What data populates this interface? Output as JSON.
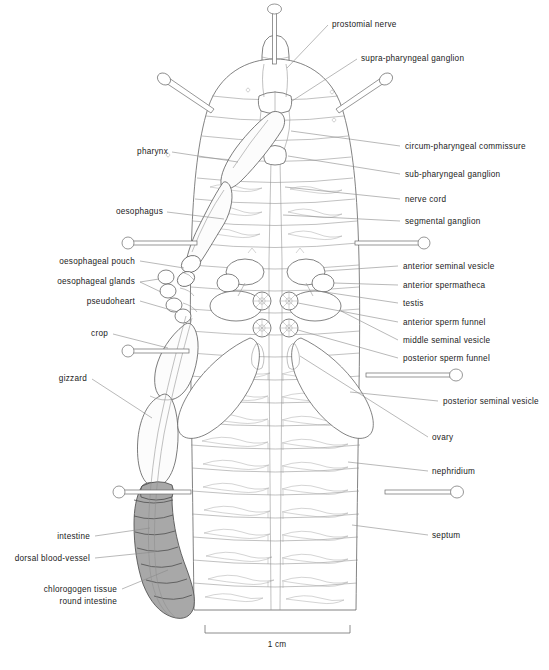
{
  "figure": {
    "background_color": "#ffffff",
    "line_color": "#5a5a5a",
    "label_color": "#1a1a1a",
    "leader_color": "#8a8a8a",
    "intestine_fill": "#a8a8a8"
  },
  "scale": {
    "label": "1 cm",
    "bar_left_px": 205,
    "bar_right_px": 350,
    "bar_y_px": 631
  },
  "labels_right": [
    {
      "id": "prostomial-nerve",
      "text": "prostomial nerve",
      "x": 332,
      "y": 27
    },
    {
      "id": "supra-pharyngeal-ganglion",
      "text": "supra-pharyngeal ganglion",
      "x": 361,
      "y": 61
    },
    {
      "id": "circum-pharyngeal-commissure",
      "text": "circum-pharyngeal commissure",
      "x": 405,
      "y": 149
    },
    {
      "id": "sub-pharyngeal-ganglion",
      "text": "sub-pharyngeal ganglion",
      "x": 405,
      "y": 177
    },
    {
      "id": "nerve-cord",
      "text": "nerve cord",
      "x": 405,
      "y": 202
    },
    {
      "id": "segmental-ganglion",
      "text": "segmental ganglion",
      "x": 405,
      "y": 224
    },
    {
      "id": "anterior-seminal-vesicle",
      "text": "anterior seminal vesicle",
      "x": 403,
      "y": 269
    },
    {
      "id": "anterior-spermatheca",
      "text": "anterior spermatheca",
      "x": 403,
      "y": 288
    },
    {
      "id": "testis",
      "text": "testis",
      "x": 403,
      "y": 306
    },
    {
      "id": "anterior-sperm-funnel",
      "text": "anterior sperm funnel",
      "x": 403,
      "y": 325
    },
    {
      "id": "middle-seminal-vesicle",
      "text": "middle seminal vesicle",
      "x": 403,
      "y": 343
    },
    {
      "id": "posterior-sperm-funnel",
      "text": "posterior sperm funnel",
      "x": 403,
      "y": 361
    },
    {
      "id": "posterior-seminal-vesicle",
      "text": "posterior seminal vesicle",
      "x": 443,
      "y": 404
    },
    {
      "id": "ovary",
      "text": "ovary",
      "x": 432,
      "y": 440
    },
    {
      "id": "nephridium",
      "text": "nephridium",
      "x": 432,
      "y": 474
    },
    {
      "id": "septum",
      "text": "septum",
      "x": 432,
      "y": 538
    }
  ],
  "labels_left": [
    {
      "id": "pharynx",
      "text": "pharynx",
      "x": 168,
      "y": 154
    },
    {
      "id": "oesophagus",
      "text": "oesophagus",
      "x": 163,
      "y": 214
    },
    {
      "id": "oesophageal-pouch",
      "text": "oesophageal pouch",
      "x": 135,
      "y": 264
    },
    {
      "id": "oesophageal-glands",
      "text": "oesophageal glands",
      "x": 135,
      "y": 284
    },
    {
      "id": "pseudoheart",
      "text": "pseudoheart",
      "x": 135,
      "y": 304
    },
    {
      "id": "crop",
      "text": "crop",
      "x": 108,
      "y": 336
    },
    {
      "id": "gizzard",
      "text": "gizzard",
      "x": 87,
      "y": 381
    },
    {
      "id": "intestine",
      "text": "intestine",
      "x": 90,
      "y": 539
    },
    {
      "id": "dorsal-blood-vessel",
      "text": "dorsal blood-vessel",
      "x": 90,
      "y": 561
    }
  ],
  "labels_left_two_line": [
    {
      "id": "chlorogogen-tissue-round-intestine",
      "line1": "chlorogogen tissue",
      "line2": "round intestine",
      "x": 117,
      "y1": 592,
      "y2": 604
    }
  ]
}
